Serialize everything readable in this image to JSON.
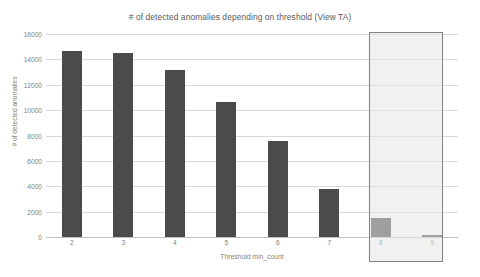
{
  "chart_data": {
    "type": "bar",
    "title": "# of detected anomalies depending on threshold (View TA)",
    "xlabel": "Threshold min_count",
    "ylabel": "# of detected anomalies",
    "categories": [
      "2",
      "3",
      "4",
      "5",
      "6",
      "7",
      "8",
      "9"
    ],
    "values": [
      14650,
      14480,
      13150,
      10680,
      7550,
      3800,
      1500,
      130
    ],
    "series": [
      {
        "name": "# of detected anomalies",
        "values": [
          14650,
          14480,
          13150,
          10680,
          7550,
          3800,
          1500,
          130
        ]
      }
    ],
    "ylim": [
      0,
      16000
    ],
    "ytick_values": [
      0,
      2000,
      4000,
      6000,
      8000,
      10000,
      12000,
      14000,
      16000
    ],
    "ytick_labels": [
      "0",
      "2000",
      "4000",
      "6000",
      "8000",
      "10000",
      "12000",
      "14000",
      "16000"
    ],
    "grid": true,
    "legend": false,
    "legend_position": "none",
    "bar_color": "#4b4b4b",
    "gridline_color": "#d9d9d9",
    "text_color": "#7f7f7f",
    "annotations": [
      {
        "name": "highlight-region",
        "type": "rectangle",
        "covers_categories": [
          "8",
          "9"
        ],
        "fill_color": "#e5e5e5",
        "border_color": "#808080"
      }
    ]
  }
}
